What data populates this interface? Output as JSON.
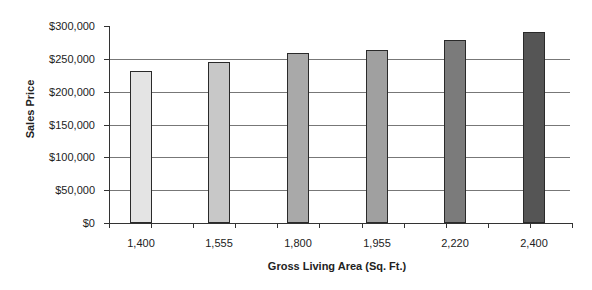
{
  "chart_data": {
    "type": "bar",
    "title": "",
    "xlabel": "Gross Living Area (Sq. Ft.)",
    "ylabel": "Sales Price",
    "categories": [
      "1,400",
      "1,555",
      "1,800",
      "1,955",
      "2,220",
      "2,400"
    ],
    "values": [
      232000,
      245000,
      259000,
      263000,
      279000,
      291000
    ],
    "bar_colors": [
      "#e4e4e4",
      "#c8c8c8",
      "#a9a9a9",
      "#a0a0a0",
      "#7b7b7b",
      "#555555"
    ],
    "ylim": [
      0,
      300000
    ],
    "yticks": [
      "$0",
      "$50,000",
      "$100,000",
      "$150,000",
      "$200,000",
      "$250,000",
      "$300,000"
    ],
    "ytick_values": [
      0,
      50000,
      100000,
      150000,
      200000,
      250000,
      300000
    ],
    "grid": true,
    "legend": null
  }
}
